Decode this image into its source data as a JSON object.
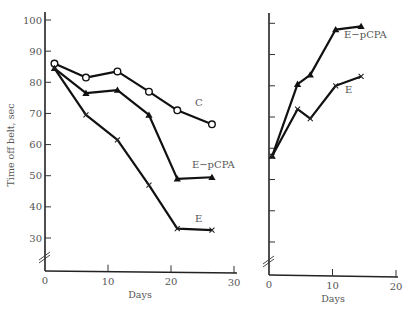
{
  "chart_data": [
    {
      "type": "line",
      "panel": "left",
      "title": "",
      "xlabel": "Days",
      "ylabel": "Time off belt, sec",
      "xlim": [
        0,
        30
      ],
      "ylim": [
        0,
        100
      ],
      "y_axis_break": "between 0 and 30",
      "xticks": [
        0,
        10,
        20,
        30
      ],
      "xtick_labels": [
        "0",
        "10",
        "20",
        "30"
      ],
      "yticks": [
        30,
        40,
        50,
        60,
        70,
        80,
        90,
        100
      ],
      "ytick_labels": [
        "30",
        "40",
        "50",
        "60",
        "70",
        "80",
        "90",
        "100"
      ],
      "grid": false,
      "legend": "inline labels at line ends",
      "series": [
        {
          "name": "C",
          "marker": "open-circle",
          "x": [
            1.5,
            6.5,
            11.5,
            16.5,
            21,
            26.5
          ],
          "values": [
            86,
            81.5,
            83.5,
            77,
            71,
            66.5
          ]
        },
        {
          "name": "E−pCPA",
          "marker": "filled-triangle",
          "x": [
            1.5,
            6.5,
            11.5,
            16.5,
            21,
            26.5
          ],
          "values": [
            84.5,
            76.5,
            77.5,
            69.5,
            49,
            49.5
          ]
        },
        {
          "name": "E",
          "marker": "cross",
          "x": [
            1.5,
            6.5,
            11.5,
            16.5,
            21,
            26.5
          ],
          "values": [
            84.5,
            69.5,
            61.5,
            47,
            33,
            32.5
          ]
        }
      ]
    },
    {
      "type": "line",
      "panel": "right",
      "title": "",
      "xlabel": "Days",
      "ylabel": "",
      "xlim": [
        0,
        20
      ],
      "ylim": [
        0,
        100
      ],
      "y_axis_break": "between 0 and 30",
      "xticks": [
        0,
        10,
        20
      ],
      "xtick_labels": [
        "0",
        "10",
        "20"
      ],
      "yticks": [
        30,
        40,
        50,
        60,
        70,
        80,
        90,
        100
      ],
      "ytick_labels": [],
      "grid": false,
      "legend": "inline labels at line ends",
      "series": [
        {
          "name": "E−pCPA",
          "marker": "filled-triangle",
          "x": [
            0.5,
            4.5,
            6.5,
            10.5,
            14.5
          ],
          "values": [
            57.5,
            80.5,
            83.5,
            98,
            99
          ]
        },
        {
          "name": "E",
          "marker": "cross",
          "x": [
            0.5,
            4.5,
            6.5,
            10.5,
            14.5
          ],
          "values": [
            57.5,
            72.5,
            69.5,
            80,
            83
          ]
        }
      ]
    }
  ]
}
